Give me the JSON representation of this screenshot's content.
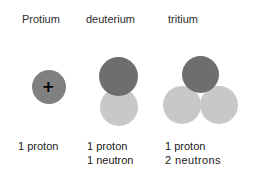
{
  "diagram": {
    "title_row": {
      "protium": "Protium",
      "deuterium": "deuterium",
      "tritium": "tritium"
    },
    "isotopes": [
      {
        "name": "Protium",
        "proton_count": 1,
        "neutron_count": 0,
        "charge_symbol": "+",
        "caption_line1": "1 proton",
        "caption_line2": ""
      },
      {
        "name": "deuterium",
        "proton_count": 1,
        "neutron_count": 1,
        "charge_symbol": "+",
        "caption_line1": "1 proton",
        "caption_line2": "1 neutron"
      },
      {
        "name": "tritium",
        "proton_count": 1,
        "neutron_count": 2,
        "charge_symbol": "+",
        "caption_line1": "1 proton",
        "caption_line2": "2 neutrons"
      }
    ],
    "colors": {
      "background": "#ffffff",
      "proton_light": "#808080",
      "proton_dark": "#6e6e6e",
      "neutron": "#c8c8c8",
      "charge_symbol": "#000000",
      "text": "#1a1a1a"
    }
  }
}
